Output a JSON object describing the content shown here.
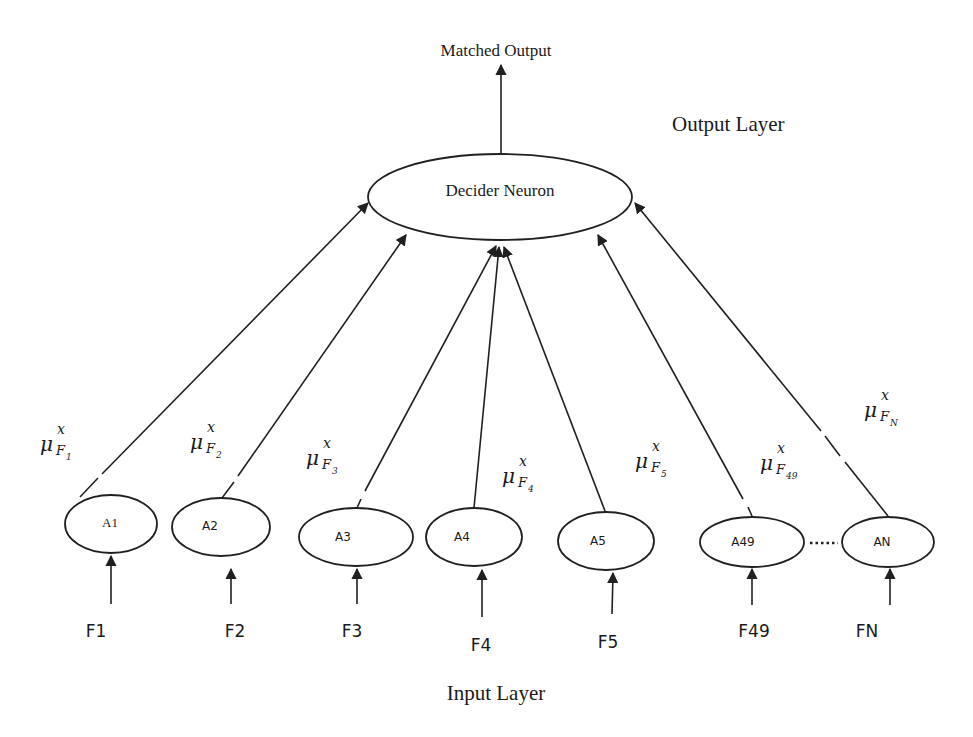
{
  "diagram": {
    "title": "Matched Output",
    "output_layer_label": "Output Layer",
    "input_layer_label": "Input Layer",
    "decider": {
      "label": "Decider Neuron"
    },
    "ellipsis": "……",
    "nodes": [
      {
        "id": "A1",
        "label": "A1",
        "input": "F1",
        "mu_base": "μ",
        "mu_sup": "x",
        "mu_sub": "F",
        "mu_subsub": "1"
      },
      {
        "id": "A2",
        "label": "A2",
        "input": "F2",
        "mu_base": "μ",
        "mu_sup": "x",
        "mu_sub": "F",
        "mu_subsub": "2"
      },
      {
        "id": "A3",
        "label": "A3",
        "input": "F3",
        "mu_base": "μ",
        "mu_sup": "x",
        "mu_sub": "F",
        "mu_subsub": "3"
      },
      {
        "id": "A4",
        "label": "A4",
        "input": "F4",
        "mu_base": "μ",
        "mu_sup": "x",
        "mu_sub": "F",
        "mu_subsub": "4"
      },
      {
        "id": "A5",
        "label": "A5",
        "input": "F5",
        "mu_base": "μ",
        "mu_sup": "x",
        "mu_sub": "F",
        "mu_subsub": "5"
      },
      {
        "id": "A49",
        "label": "A49",
        "input": "F49",
        "mu_base": "μ",
        "mu_sup": "x",
        "mu_sub": "F",
        "mu_subsub": "49"
      },
      {
        "id": "AN",
        "label": "AN",
        "input": "FN",
        "mu_base": "μ",
        "mu_sup": "x",
        "mu_sub": "F",
        "mu_subsub": "N"
      }
    ]
  }
}
